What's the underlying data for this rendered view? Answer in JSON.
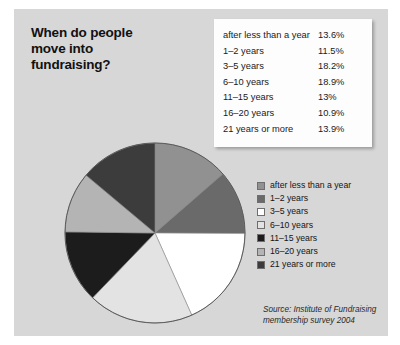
{
  "title": {
    "line1": "When do people",
    "line2": "move into",
    "line3": "fundraising?"
  },
  "source": {
    "line1": "Source: Institute of Fundraising",
    "line2": "membership survey 2004"
  },
  "table": {
    "rows": [
      {
        "label": "after less than a year",
        "value": "13.6%"
      },
      {
        "label": "1–2 years",
        "value": "11.5%"
      },
      {
        "label": "3–5 years",
        "value": "18.2%"
      },
      {
        "label": "6–10 years",
        "value": "18.9%"
      },
      {
        "label": "11–15 years",
        "value": "13%"
      },
      {
        "label": "16–20 years",
        "value": "10.9%"
      },
      {
        "label": "21 years or more",
        "value": "13.9%"
      }
    ]
  },
  "legend": {
    "items": [
      {
        "label": "after less than a year",
        "color": "#919191"
      },
      {
        "label": "1–2 years",
        "color": "#6a6a6a"
      },
      {
        "label": "3–5 years",
        "color": "#ffffff"
      },
      {
        "label": "6–10 years",
        "color": "#e3e3e3"
      },
      {
        "label": "11–15 years",
        "color": "#1c1c1c"
      },
      {
        "label": "16–20 years",
        "color": "#b4b4b4"
      },
      {
        "label": "21 years or more",
        "color": "#3c3c3c"
      }
    ]
  },
  "chart_data": {
    "type": "pie",
    "title": "When do people move into fundraising?",
    "xlabel": "",
    "ylabel": "",
    "unit": "%",
    "start_angle_deg": 0,
    "direction": "clockwise",
    "legend_position": "right",
    "grid": false,
    "categories": [
      "after less than a year",
      "1–2 years",
      "3–5 years",
      "6–10 years",
      "11–15 years",
      "16–20 years",
      "21 years or more"
    ],
    "values": [
      13.6,
      11.5,
      18.2,
      18.9,
      13.0,
      10.9,
      13.9
    ],
    "value_labels": [
      "13.6%",
      "11.5%",
      "18.2%",
      "18.9%",
      "13%",
      "10.9%",
      "13.9%"
    ],
    "colors": [
      "#919191",
      "#6a6a6a",
      "#ffffff",
      "#e3e3e3",
      "#1c1c1c",
      "#b4b4b4",
      "#3c3c3c"
    ],
    "total": 100.0,
    "annotation": "Source: Institute of Fundraising membership survey 2004"
  },
  "style": {
    "panel_background": "#d7d7d7",
    "page_background": "#ffffff",
    "table_background": "#fdfdfd",
    "text_color": "#111111",
    "pie_outline": "#5a5a5a"
  }
}
